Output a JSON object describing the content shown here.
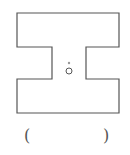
{
  "figure": {
    "shape": "I-beam",
    "stroke_color": "#555555",
    "center_point_label": "O",
    "answer_blank": {
      "open": "(",
      "close": ")"
    }
  }
}
